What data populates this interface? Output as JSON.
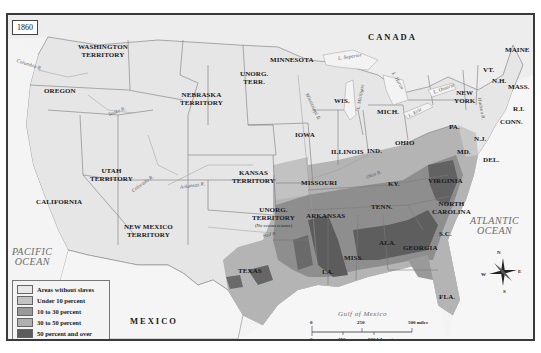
{
  "map": {
    "year": "1860",
    "countries": {
      "canada": "CANADA",
      "mexico": "MEXICO"
    },
    "oceans": {
      "pacific": [
        "PACIFIC",
        "OCEAN"
      ],
      "atlantic": [
        "ATLANTIC",
        "OCEAN"
      ],
      "gulf": "Gulf of Mexico"
    },
    "regions": {
      "washington": [
        "WASHINGTON",
        "TERRITORY"
      ],
      "oregon": "OREGON",
      "california": "CALIFORNIA",
      "utah": [
        "UTAH",
        "TERRITORY"
      ],
      "new_mexico": [
        "NEW MEXICO",
        "TERRITORY"
      ],
      "nebraska": [
        "NEBRASKA",
        "TERRITORY"
      ],
      "unorg_north": [
        "UNORG.",
        "TERR."
      ],
      "kansas": [
        "KANSAS",
        "TERRITORY"
      ],
      "unorg_south": [
        "UNORG.",
        "TERRITORY"
      ],
      "unorg_south_note": "(No census returns)",
      "texas": "TEXAS",
      "minnesota": "MINNESOTA",
      "iowa": "IOWA",
      "missouri": "MISSOURI",
      "arkansas": "ARKANSAS",
      "louisiana": "LA.",
      "wisconsin": "WIS.",
      "illinois": "ILLINOIS",
      "michigan": "MICH.",
      "indiana": "IND.",
      "ohio": "OHIO",
      "kentucky": "KY.",
      "tennessee": "TENN.",
      "mississippi": "MISS.",
      "alabama": "ALA.",
      "georgia": "GEORGIA",
      "florida": "FLA.",
      "south_carolina": "S.C.",
      "north_carolina": [
        "NORTH",
        "CAROLINA"
      ],
      "virginia": "VIRGINIA",
      "maryland": "MD.",
      "delaware": "DEL.",
      "new_jersey": "N.J.",
      "pennsylvania": "PA.",
      "new_york": [
        "NEW",
        "YORK"
      ],
      "vermont": "VT.",
      "new_hampshire": "N.H.",
      "massachusetts": "MASS.",
      "rhode_island": "R.I.",
      "connecticut": "CONN.",
      "maine": "MAINE"
    },
    "rivers": {
      "columbia": "Columbia R.",
      "snake": "Snake R.",
      "colorado": "Colorado R.",
      "arkansas": "Arkansas R.",
      "red": "Red R.",
      "mississippi": "Mississippi R.",
      "ohio": "Ohio R.",
      "hudson": "Hudson R."
    },
    "lakes": {
      "superior": "L. Superior",
      "michigan": "L. Michigan",
      "huron": "L. Huron",
      "erie": "L. Erie",
      "ontario": "L. Ontario"
    },
    "compass": {
      "n": "N",
      "s": "S",
      "e": "E",
      "w": "W"
    }
  },
  "legend": {
    "items": [
      {
        "label": "Areas without slaves",
        "color": "#e8e8e8"
      },
      {
        "label": "Under 10 percent",
        "color": "#c4c4c4"
      },
      {
        "label": "10 to 30 percent",
        "color": "#9a9a9a"
      },
      {
        "label": "30 to 50 percent",
        "color": "#b0b0b0"
      },
      {
        "label": "50 percent and over",
        "color": "#5c5c5c"
      }
    ]
  },
  "scale": {
    "miles": [
      "0",
      "250",
      "500 miles"
    ],
    "km": [
      "0",
      "250",
      "500 kilometers"
    ]
  },
  "colors": {
    "frame": "#3a3a3a",
    "land_free": "#e9e9e9",
    "water": "#f6f6f6",
    "border": "#7a7a7a",
    "slave_under10": "#c4c4c4",
    "slave_10_30": "#9a9a9a",
    "slave_30_50": "#b0b0b0",
    "slave_50plus": "#5c5c5c"
  }
}
